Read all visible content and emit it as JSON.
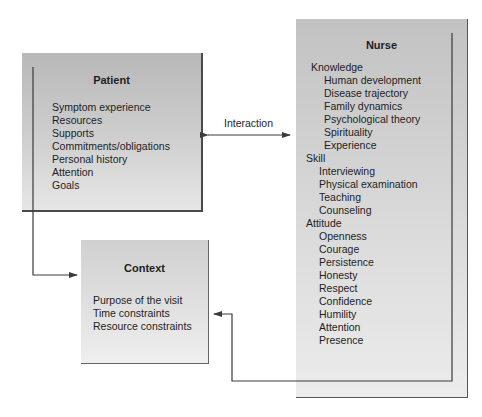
{
  "patient": {
    "title": "Patient",
    "items": [
      "Symptom experience",
      "Resources",
      "Supports",
      "Commitments/obligations",
      "Personal history",
      "Attention",
      "Goals"
    ]
  },
  "interaction": {
    "label": "Interaction"
  },
  "nurse": {
    "title": "Nurse",
    "groups": [
      {
        "heading": "Knowledge",
        "items": [
          "Human development",
          "Disease trajectory",
          "Family dynamics",
          "Psychological theory",
          "Spirituality",
          "Experience"
        ]
      },
      {
        "heading": "Skill",
        "items": [
          "Interviewing",
          "Physical examination",
          "Teaching",
          "Counseling"
        ]
      },
      {
        "heading": "Attitude",
        "items": [
          "Openness",
          "Courage",
          "Persistence",
          "Honesty",
          "Respect",
          "Confidence",
          "Humility",
          "Attention",
          "Presence"
        ]
      }
    ]
  },
  "context": {
    "title": "Context",
    "items": [
      "Purpose of the visit",
      "Time constraints",
      "Resource constraints"
    ]
  },
  "colors": {
    "line": "#3a3a3a",
    "box_border": "#4a4a4a"
  }
}
